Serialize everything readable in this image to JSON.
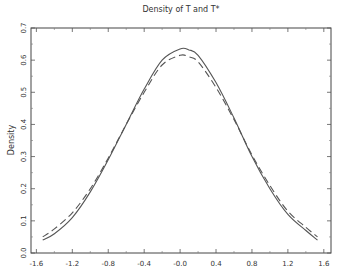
{
  "chart_data": {
    "type": "line",
    "title": "Density of T and T*",
    "xlabel": "",
    "ylabel": "Density",
    "xlim": [
      -1.66,
      1.68
    ],
    "ylim": [
      0.0,
      0.7
    ],
    "xticks": [
      -1.6,
      -1.2,
      -0.8,
      -0.4,
      0.0,
      0.4,
      0.8,
      1.2,
      1.6
    ],
    "xtick_labels": [
      "-1.6",
      "-1.2",
      "-0.8",
      "-0.4",
      "-0.0",
      "0.4",
      "0.8",
      "1.2",
      "1.6"
    ],
    "yticks": [
      0.0,
      0.1,
      0.2,
      0.3,
      0.4,
      0.5,
      0.6,
      0.7
    ],
    "ytick_labels": [
      "0.0",
      "0.1",
      "0.2",
      "0.3",
      "0.4",
      "0.5",
      "0.6",
      "0.7"
    ],
    "grid": false,
    "legend": null,
    "series": [
      {
        "name": "T",
        "style": "solid",
        "x": [
          -1.53,
          -1.4,
          -1.2,
          -1.0,
          -0.8,
          -0.6,
          -0.4,
          -0.2,
          0.0,
          0.1,
          0.2,
          0.4,
          0.6,
          0.8,
          1.0,
          1.2,
          1.4,
          1.53
        ],
        "y": [
          0.04,
          0.06,
          0.11,
          0.19,
          0.29,
          0.4,
          0.51,
          0.6,
          0.635,
          0.632,
          0.615,
          0.53,
          0.42,
          0.3,
          0.2,
          0.12,
          0.07,
          0.04
        ]
      },
      {
        "name": "T*",
        "style": "dashed",
        "x": [
          -1.53,
          -1.4,
          -1.2,
          -1.0,
          -0.8,
          -0.6,
          -0.4,
          -0.2,
          0.0,
          0.1,
          0.2,
          0.4,
          0.6,
          0.8,
          1.0,
          1.2,
          1.4,
          1.53
        ],
        "y": [
          0.05,
          0.075,
          0.125,
          0.2,
          0.295,
          0.4,
          0.5,
          0.585,
          0.615,
          0.61,
          0.595,
          0.515,
          0.415,
          0.305,
          0.21,
          0.13,
          0.08,
          0.05
        ]
      }
    ]
  }
}
